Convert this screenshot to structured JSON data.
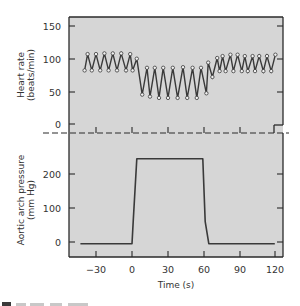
{
  "chart_data": [
    {
      "type": "line",
      "panel": "top",
      "title": "",
      "xlabel": "",
      "ylabel": "Heart rate",
      "ylabel_units": "(beats/min)",
      "ylim": [
        -12,
        160
      ],
      "yticks": [
        0,
        50,
        100,
        150
      ],
      "xlim": [
        -52,
        126
      ],
      "markers": "open-circle",
      "series": [
        {
          "name": "Heart rate",
          "x": [
            -39.5,
            -37,
            -33.5,
            -30,
            -26.5,
            -23,
            -19.5,
            -16,
            -12.5,
            -9,
            -5,
            -1.5,
            0.5,
            4,
            8.5,
            12.5,
            15,
            19,
            22.5,
            26,
            30,
            34,
            38,
            42.5,
            46,
            50.5,
            54,
            57.5,
            62,
            63.5,
            67,
            71,
            73,
            75.5,
            78,
            82,
            84.5,
            88,
            91.5,
            94,
            96.5,
            100.5,
            102.5,
            106,
            109.5,
            112.5,
            116,
            119.5
          ],
          "y": [
            82,
            107,
            82,
            107,
            82,
            108,
            82,
            108,
            82,
            108,
            82,
            107,
            82,
            100,
            45,
            86,
            42,
            86,
            40,
            86,
            40,
            86,
            40,
            87,
            40,
            86,
            40,
            86,
            47,
            94,
            72,
            101,
            81,
            104,
            81,
            106,
            81,
            106,
            81,
            104,
            81,
            104,
            81,
            104,
            81,
            104,
            81,
            106
          ]
        }
      ]
    },
    {
      "type": "line",
      "panel": "bottom",
      "title": "",
      "xlabel": "Time (s)",
      "ylabel": "Aortic arch pressure",
      "ylabel_units": "(mm Hg)",
      "ylim": [
        -45,
        280
      ],
      "yticks": [
        0,
        100,
        200
      ],
      "xticks": [
        -30,
        0,
        30,
        60,
        90,
        120
      ],
      "xlim": [
        -52,
        126
      ],
      "series": [
        {
          "name": "Aortic arch pressure",
          "x": [
            -43,
            0,
            1,
            4,
            59,
            61,
            64,
            119
          ],
          "y": [
            -5,
            -5,
            60,
            245,
            245,
            60,
            -5,
            -5
          ]
        }
      ]
    }
  ],
  "labels": {
    "top_ylabel_1": "Heart rate",
    "top_ylabel_2": "(beats/min)",
    "bottom_ylabel_1": "Aortic arch pressure",
    "bottom_ylabel_2": "(mm Hg)",
    "xlabel": "Time (s)",
    "top_yticks": [
      "150",
      "100",
      "50",
      "0"
    ],
    "bottom_yticks": [
      "200",
      "100",
      "0"
    ],
    "xticks": [
      "−30",
      "0",
      "30",
      "60",
      "90",
      "120"
    ]
  },
  "colors": {
    "panel_fill": "#d6d6d6",
    "line": "#3a3a3a",
    "marker_fill": "#f2f2f2",
    "text": "#333333"
  }
}
